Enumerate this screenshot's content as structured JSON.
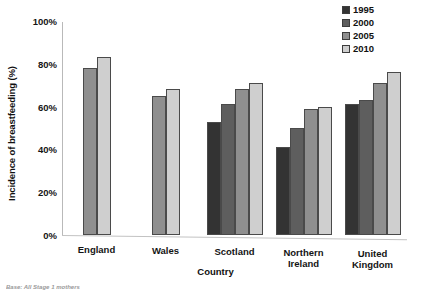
{
  "chart_data": {
    "type": "bar",
    "title": "",
    "xlabel": "Country",
    "ylabel": "Incidence of breastfeeding (%)",
    "ylim": [
      0,
      100
    ],
    "grid": false,
    "legend_position": "top-right",
    "categories": [
      "England",
      "Wales",
      "Scotland",
      "Northern Ireland",
      "United Kingdom"
    ],
    "category_lines": [
      [
        "England"
      ],
      [
        "Wales"
      ],
      [
        "Scotland"
      ],
      [
        "Northern",
        "Ireland"
      ],
      [
        "United",
        "Kingdom"
      ]
    ],
    "ytick_labels": [
      "100%",
      "80%",
      "60%",
      "40%",
      "20%",
      "0%"
    ],
    "ytick_values": [
      100,
      80,
      60,
      40,
      20,
      0
    ],
    "series": [
      {
        "name": "1995",
        "color": "#333333",
        "values": [
          null,
          null,
          53,
          41,
          61
        ]
      },
      {
        "name": "2000",
        "color": "#5e5e5e",
        "values": [
          null,
          null,
          61,
          50,
          63
        ]
      },
      {
        "name": "2005",
        "color": "#8f8f8f",
        "values": [
          78,
          65,
          68,
          59,
          71
        ]
      },
      {
        "name": "2010",
        "color": "#cfcfcf",
        "values": [
          83,
          68,
          71,
          60,
          76
        ]
      }
    ]
  },
  "legend": {
    "items": [
      {
        "label": "1995",
        "color": "#333333"
      },
      {
        "label": "2000",
        "color": "#5e5e5e"
      },
      {
        "label": "2005",
        "color": "#8f8f8f"
      },
      {
        "label": "2010",
        "color": "#cfcfcf"
      }
    ]
  },
  "source_note": "Base: All Stage 1 mothers"
}
